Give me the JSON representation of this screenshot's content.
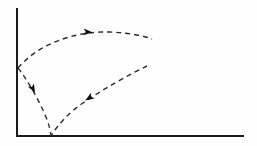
{
  "figure": {
    "title": "",
    "background_color": "#fefefe",
    "width": 257,
    "height": 146
  },
  "axes": {
    "color": "#1a1a1a",
    "stroke_width": 2,
    "origin": {
      "x": 17,
      "y": 136
    },
    "y_axis": {
      "name": "vertical-axis",
      "x": 17,
      "y_top": 9,
      "y_bottom": 136,
      "label": "",
      "ticks": []
    },
    "x_axis": {
      "name": "horizontal-axis",
      "y": 136,
      "x_left": 17,
      "x_right": 243,
      "label": "",
      "ticks": []
    }
  },
  "chart_data": {
    "type": "line",
    "title": "",
    "xlabel": "",
    "ylabel": "",
    "grid": false,
    "legend": false,
    "style": {
      "dash_pattern": "5,4",
      "curve_color": "#2b2b2b",
      "curve_stroke_width": 1.4,
      "arrow_color": "#111111"
    },
    "annotations": [
      {
        "name": "y-axis-junction-point",
        "x": 18,
        "y": 68,
        "text": ""
      },
      {
        "name": "x-axis-junction-point",
        "x": 51,
        "y": 136,
        "text": ""
      }
    ],
    "series": [
      {
        "name": "upper-arc",
        "direction": "rightward",
        "dashed": true,
        "path": "M 18 68 C 40 42, 78 31, 110 32 C 130 33, 145 36, 152 39",
        "points": [
          {
            "x": 18,
            "y": 68
          },
          {
            "x": 45,
            "y": 45
          },
          {
            "x": 75,
            "y": 34
          },
          {
            "x": 110,
            "y": 32
          },
          {
            "x": 152,
            "y": 39
          }
        ],
        "arrow": {
          "name": "upper-arc-arrowhead",
          "x": 88,
          "y": 32,
          "angle_deg": 2,
          "points_toward": "right"
        }
      },
      {
        "name": "left-descending-arc",
        "direction": "downward",
        "dashed": true,
        "path": "M 18 68 C 26 78, 38 98, 46 117 C 49 125, 51 132, 51 136",
        "points": [
          {
            "x": 18,
            "y": 68
          },
          {
            "x": 30,
            "y": 85
          },
          {
            "x": 42,
            "y": 107
          },
          {
            "x": 51,
            "y": 136
          }
        ],
        "arrow": {
          "name": "left-arc-arrowhead",
          "x": 33,
          "y": 89,
          "angle_deg": 62,
          "points_toward": "down-right"
        }
      },
      {
        "name": "lower-right-arc",
        "direction": "toward-origin",
        "dashed": true,
        "path": "M 147 66 C 130 74, 105 88, 83 103 C 68 113, 57 126, 51 136",
        "points": [
          {
            "x": 147,
            "y": 66
          },
          {
            "x": 120,
            "y": 79
          },
          {
            "x": 95,
            "y": 95
          },
          {
            "x": 70,
            "y": 113
          },
          {
            "x": 51,
            "y": 136
          }
        ],
        "arrow": {
          "name": "lower-right-arc-arrowhead",
          "x": 89,
          "y": 98,
          "angle_deg": 148,
          "points_toward": "down-left"
        }
      }
    ]
  }
}
